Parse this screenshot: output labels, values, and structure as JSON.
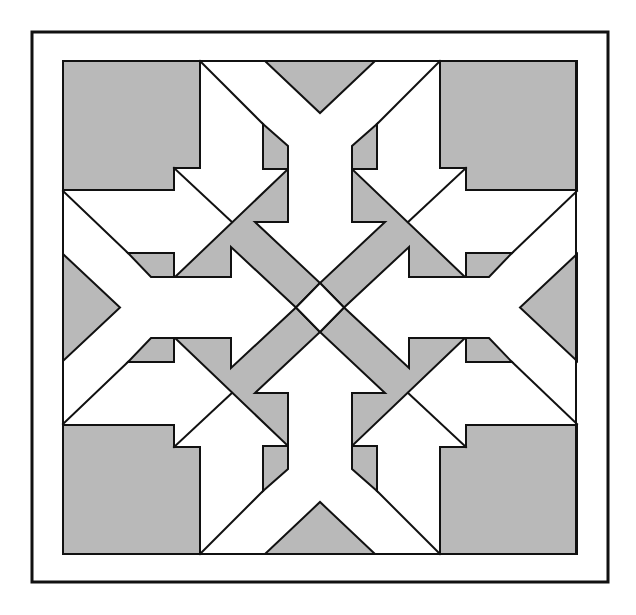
{
  "diagram": {
    "colors": {
      "gray": "#b9b9b9",
      "line": "#111111",
      "background": "#ffffff"
    },
    "frame": {
      "x": 31,
      "y": 31,
      "width": 578,
      "height": 552
    },
    "block": {
      "x": 63,
      "y": 61,
      "width": 513,
      "height": 493
    },
    "center": {
      "x": 320,
      "y": 307.5
    },
    "symmetry": "4-fold mirror (horizontal and vertical)"
  }
}
